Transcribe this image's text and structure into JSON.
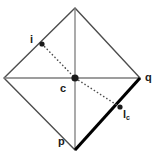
{
  "figure": {
    "colors": {
      "outline": "#4d4d4d",
      "diagonal": "#808080",
      "bold_edge": "#000000",
      "dotted_line": "#4d4d4d",
      "point_fill": "#1a1a1a",
      "label_text": "#1a1a1a",
      "background": "#ffffff"
    },
    "shape": {
      "type": "diamond",
      "vertices": {
        "top": {
          "x": 75,
          "y": 8
        },
        "right": {
          "x": 140,
          "y": 78
        },
        "bottom": {
          "x": 75,
          "y": 150
        },
        "left": {
          "x": 4,
          "y": 78
        }
      }
    },
    "diagonals": [
      {
        "name": "horizontal-diagonal",
        "x1": 4,
        "y1": 78,
        "x2": 140,
        "y2": 78
      },
      {
        "name": "vertical-diagonal",
        "x1": 75,
        "y1": 8,
        "x2": 75,
        "y2": 150
      }
    ],
    "bold_edge": {
      "name": "edge-p-q",
      "x1": 75,
      "y1": 150,
      "x2": 140,
      "y2": 78
    },
    "dotted_path": {
      "name": "line-i-c-lc",
      "points": [
        {
          "x": 42,
          "y": 44
        },
        {
          "x": 75,
          "y": 78
        },
        {
          "x": 120,
          "y": 107
        }
      ]
    },
    "points": [
      {
        "name": "point-i",
        "x": 42,
        "y": 44,
        "r": 2.6
      },
      {
        "name": "point-c",
        "x": 75,
        "y": 78,
        "r": 3.6
      },
      {
        "name": "point-lc",
        "x": 120,
        "y": 107,
        "r": 2.6
      }
    ],
    "labels": {
      "i": "i",
      "c": "c",
      "q": "q",
      "p": "p",
      "lc_base": "l",
      "lc_sub": "c"
    }
  }
}
